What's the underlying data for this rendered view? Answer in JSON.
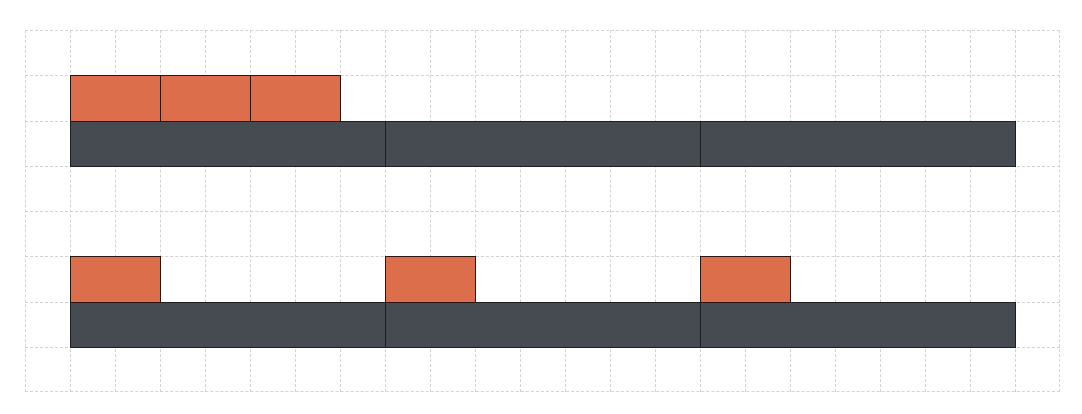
{
  "diagram": {
    "type": "grid-block-model",
    "grid": {
      "origin_x": 25,
      "origin_y": 30,
      "cols": 23,
      "rows": 8,
      "cell_w": 45.0,
      "cell_h": 45.25,
      "line_color": "#d2d2d2"
    },
    "colors": {
      "small_block": "#dd6e4c",
      "bar": "#454b50",
      "border": "#1c1e20"
    },
    "groups": [
      {
        "name": "top-group",
        "small_blocks": [
          {
            "col": 1,
            "row": 1,
            "w": 2,
            "h": 1
          },
          {
            "col": 3,
            "row": 1,
            "w": 2,
            "h": 1
          },
          {
            "col": 5,
            "row": 1,
            "w": 2,
            "h": 1
          }
        ],
        "bar_segments": [
          {
            "col": 1,
            "row": 2,
            "w": 7,
            "h": 1
          },
          {
            "col": 8,
            "row": 2,
            "w": 7,
            "h": 1
          },
          {
            "col": 15,
            "row": 2,
            "w": 7,
            "h": 1
          }
        ]
      },
      {
        "name": "bottom-group",
        "small_blocks": [
          {
            "col": 1,
            "row": 5,
            "w": 2,
            "h": 1
          },
          {
            "col": 8,
            "row": 5,
            "w": 2,
            "h": 1
          },
          {
            "col": 15,
            "row": 5,
            "w": 2,
            "h": 1
          }
        ],
        "bar_segments": [
          {
            "col": 1,
            "row": 6,
            "w": 7,
            "h": 1
          },
          {
            "col": 8,
            "row": 6,
            "w": 7,
            "h": 1
          },
          {
            "col": 15,
            "row": 6,
            "w": 7,
            "h": 1
          }
        ]
      }
    ]
  }
}
